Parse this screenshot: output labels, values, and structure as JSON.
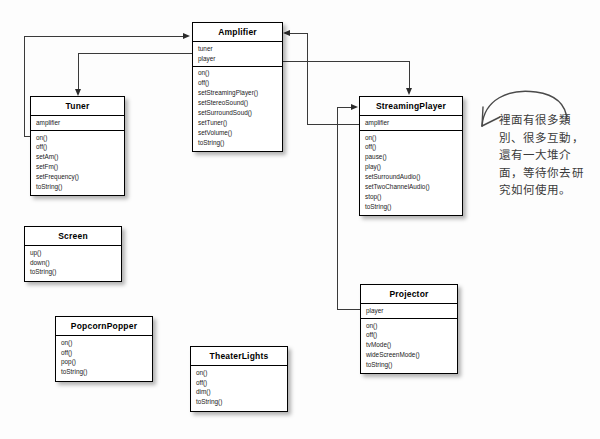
{
  "diagram": {
    "background_color": "#fdfdfd",
    "line_color": "#3a3a3a"
  },
  "classes": [
    {
      "id": "amplifier",
      "name": "Amplifier",
      "attributes": [
        "tuner",
        "player"
      ],
      "operations": [
        "on()",
        "off()",
        "setStreamingPlayer()",
        "setStereoSound()",
        "setSurroundSoud()",
        "setTuner()",
        "setVolume()",
        "toString()"
      ]
    },
    {
      "id": "tuner",
      "name": "Tuner",
      "attributes": [
        "amplifier"
      ],
      "operations": [
        "on()",
        "off()",
        "setAm()",
        "setFm()",
        "setFrequency()",
        "toString()"
      ]
    },
    {
      "id": "streamingplayer",
      "name": "StreamingPlayer",
      "attributes": [
        "amplifier"
      ],
      "operations": [
        "on()",
        "off()",
        "pause()",
        "play()",
        "setSurroundAudio()",
        "setTwoChannelAudio()",
        "stop()",
        "toString()"
      ]
    },
    {
      "id": "projector",
      "name": "Projector",
      "attributes": [
        "player"
      ],
      "operations": [
        "on()",
        "off()",
        "tvMode()",
        "wideScreenMode()",
        "toString()"
      ]
    },
    {
      "id": "screen",
      "name": "Screen",
      "attributes": [],
      "operations": [
        "up()",
        "down()",
        "toString()"
      ]
    },
    {
      "id": "popcornpopper",
      "name": "PopcornPopper",
      "attributes": [],
      "operations": [
        "on()",
        "off()",
        "pop()",
        "toString()"
      ]
    },
    {
      "id": "theaterlights",
      "name": "TheaterLights",
      "attributes": [],
      "operations": [
        "on()",
        "off()",
        "dim()",
        "toString()"
      ]
    }
  ],
  "annotation": {
    "lines": [
      "裡面有很多類",
      "別、很多互動，",
      "還有一大堆介",
      "面，等待你去研",
      "究如何使用。"
    ]
  }
}
